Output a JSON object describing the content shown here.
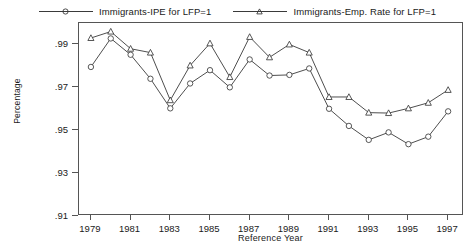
{
  "chart_data": {
    "type": "line",
    "title": "",
    "xlabel": "Reference Year",
    "ylabel": "Percentage",
    "xlim": [
      1978.4,
      1997.8
    ],
    "ylim": [
      0.91,
      1.0
    ],
    "grid": false,
    "legend_position": "top",
    "y_ticks": [
      0.99,
      0.97,
      0.95,
      0.93,
      0.91
    ],
    "y_tick_labels": [
      ".99",
      ".97",
      ".95",
      ".93",
      ".91"
    ],
    "x_ticks": [
      1979,
      1981,
      1983,
      1985,
      1987,
      1989,
      1991,
      1993,
      1995,
      1997
    ],
    "x_tick_labels": [
      "1979",
      "1981",
      "1983",
      "1985",
      "1987",
      "1989",
      "1991",
      "1993",
      "1995",
      "1997"
    ],
    "x": [
      1979,
      1980,
      1981,
      1982,
      1983,
      1984,
      1985,
      1986,
      1987,
      1988,
      1989,
      1990,
      1991,
      1992,
      1993,
      1994,
      1995,
      1996,
      1997
    ],
    "series": [
      {
        "name": "Immigrants-IPE for LFP=1",
        "marker": "circle",
        "color": "#3a3a3a",
        "values": [
          0.9795,
          0.9928,
          0.9852,
          0.974,
          0.9602,
          0.9718,
          0.978,
          0.97,
          0.983,
          0.9755,
          0.9758,
          0.9788,
          0.96,
          0.952,
          0.9455,
          0.949,
          0.9435,
          0.947,
          0.9588
        ]
      },
      {
        "name": "Immigrants-Emp. Rate for LFP=1",
        "marker": "triangle",
        "color": "#3a3a3a",
        "values": [
          0.993,
          0.996,
          0.988,
          0.9862,
          0.964,
          0.9802,
          0.9905,
          0.9748,
          0.9935,
          0.984,
          0.99,
          0.9862,
          0.9655,
          0.9655,
          0.9582,
          0.958,
          0.9602,
          0.9628,
          0.9688
        ]
      }
    ]
  },
  "legend": {
    "entries": [
      {
        "label": "Immigrants-IPE for LFP=1",
        "marker": "circle-marker"
      },
      {
        "label": "Immigrants-Emp. Rate for LFP=1",
        "marker": "triangle-marker"
      }
    ]
  },
  "axes": {
    "y_title": "Percentage",
    "x_title": "Reference Year"
  }
}
